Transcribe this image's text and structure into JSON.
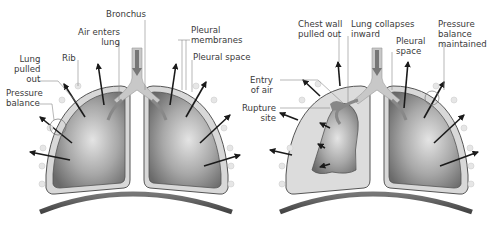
{
  "diagram": {
    "left_panel": {
      "title": "Normal lung",
      "labels": {
        "bronchus": "Bronchus",
        "air_enters": "Air enters\nlung",
        "pleural_membranes": "Pleural\nmembranes",
        "pleural_space": "Pleural space",
        "rib": "Rib",
        "lung_pulled_out": "Lung\npulled\nout",
        "pressure_balance": "Pressure\nbalance"
      }
    },
    "right_panel": {
      "title": "Collapsed lung (pneumothorax)",
      "labels": {
        "chest_wall": "Chest wall\npulled out",
        "lung_collapses": "Lung collapses\ninward",
        "pleural_space": "Pleural\nspace",
        "pressure_maintained": "Pressure\nbalance\nmaintained",
        "entry_of_air": "Entry\nof air",
        "rupture_site": "Rupture\nsite"
      }
    },
    "colors": {
      "lung_dark": "#6f6f6f",
      "lung_light": "#d9d9d9",
      "pleura": "#d6d6d6",
      "outline": "#555555",
      "diaphragm": "#5a5a5a",
      "arrow": "#1a1a1a",
      "airway": "#bdbdbd"
    }
  }
}
